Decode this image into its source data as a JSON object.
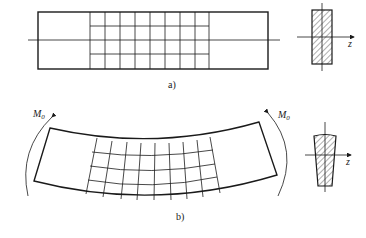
{
  "figure_a": {
    "label": "a)",
    "axis_label": "z",
    "beam": {
      "x": 38,
      "y": 12,
      "width": 230,
      "height": 57
    },
    "grid": {
      "x_start": 90,
      "x_end": 209,
      "columns": 8,
      "rows": 4
    }
  },
  "figure_b": {
    "label": "b)",
    "axis_label": "z",
    "moment_left": {
      "symbol": "M",
      "subscript": "0"
    },
    "moment_right": {
      "symbol": "M",
      "subscript": "0"
    }
  },
  "colors": {
    "line": "#1a1a1a",
    "background": "#ffffff"
  }
}
